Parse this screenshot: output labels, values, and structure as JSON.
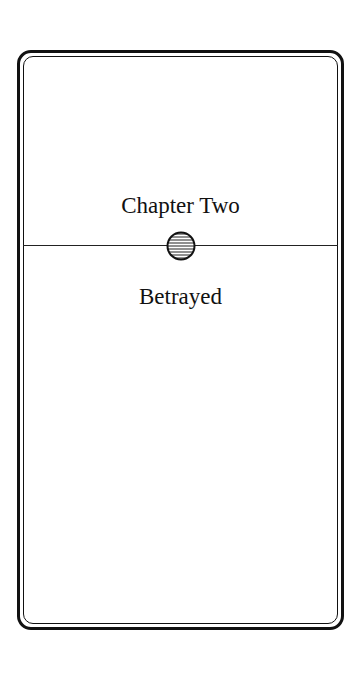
{
  "page": {
    "chapter_label": "Chapter Two",
    "chapter_title": "Betrayed",
    "emblem_icon": "striped-circle-icon"
  },
  "colors": {
    "ink": "#111111",
    "background": "#ffffff"
  }
}
